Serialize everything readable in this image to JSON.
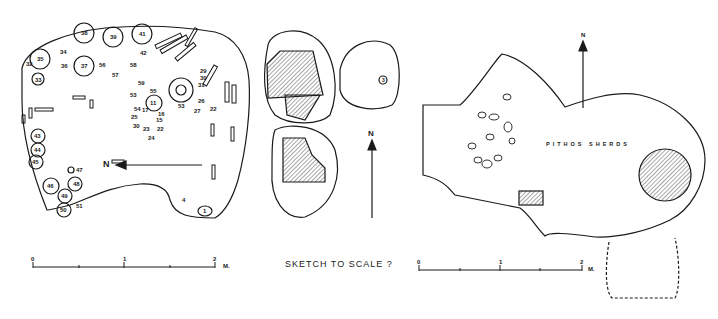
{
  "figure": {
    "panels": [
      {
        "id": "plan-left",
        "north_label": "N",
        "scale": {
          "ticks": [
            "0",
            "1",
            "2"
          ],
          "unit": "M."
        },
        "find_numbers": [
          "1",
          "4",
          "11",
          "13",
          "14",
          "15",
          "16",
          "17",
          "19",
          "20",
          "21",
          "22",
          "23",
          "24",
          "25",
          "26",
          "27",
          "29",
          "30",
          "31",
          "32",
          "33",
          "34",
          "35",
          "36",
          "37",
          "38",
          "39",
          "40",
          "41",
          "42",
          "43",
          "44",
          "45",
          "46",
          "47",
          "48",
          "49",
          "50",
          "51",
          "52",
          "53",
          "54",
          "55",
          "56",
          "57",
          "58",
          "59"
        ]
      },
      {
        "id": "sketch-middle",
        "north_label": "N",
        "find_numbers": [
          "3"
        ],
        "caption": "SKETCH TO SCALE ?"
      },
      {
        "id": "plan-right",
        "north_label": "N",
        "annotation": "PITHOS SHERDS",
        "scale": {
          "ticks": [
            "0",
            "1",
            "2"
          ],
          "unit": "M."
        }
      }
    ]
  },
  "colors": {
    "ink": "#1a1a1a",
    "paper": "#ffffff"
  }
}
